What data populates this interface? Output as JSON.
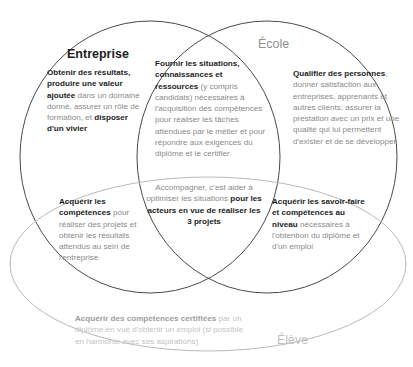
{
  "diagram": {
    "title_fragment": "",
    "sets": [
      {
        "id": "entreprise",
        "label": "Entreprise"
      },
      {
        "id": "ecole",
        "label": "École"
      },
      {
        "id": "eleve",
        "label": "Élève"
      }
    ],
    "regions": {
      "entreprise_only": {
        "bold_lead": "Obtenir des résultats, produire une valeur ajoutée",
        "rest": " dans un domaine donné, assurer un rôle de formation, et ",
        "bold_tail": "disposer d'un vivier"
      },
      "ecole_only": {
        "bold_lead": "Qualifier des personnes",
        "rest": ", donner satisfaction aux entreprises, apprenants et autres clients; assurer la prestation avec un prix et une qualité qui lui permettent d'exister et de se développer"
      },
      "entreprise_ecole": {
        "bold_lead": "Fournir les situations, connaissances et ressources",
        "rest": " (y compris candidats) nécessaires à l'acquisition des compétences pour réaliser les tâches attendues par le métier et pour répondre aux exigences du diplôme et le certifier."
      },
      "center_all": {
        "rest": "Accompagner, c'est aider à optimiser les situations ",
        "bold_tail": "pour les acteurs en vue de réaliser les 3 projets"
      },
      "entreprise_eleve": {
        "bold_lead": "Acquérir les compétences",
        "rest": " pour réaliser des projets et obtenir les résultats attendus au sein de l'entreprise"
      },
      "ecole_eleve": {
        "bold_lead": "Acquérir les savoir-faire et compétences au niveau",
        "rest": " nécessaires à l'obtention du diplôme et d'un emploi"
      },
      "eleve_only": {
        "bold_lead": "Acquérir des compétences certifiées",
        "rest": " par un diplôme en vue d'obtenir un emploi (si possible en harmonie avec ses aspirations)"
      }
    },
    "colors": {
      "stroke_dark": "#4a4a4a",
      "stroke_faint": "#b9b9b9",
      "text_bold": "#1d1d1d",
      "text_body": "#8a8a8a",
      "text_faint": "#c4c4c4"
    }
  }
}
